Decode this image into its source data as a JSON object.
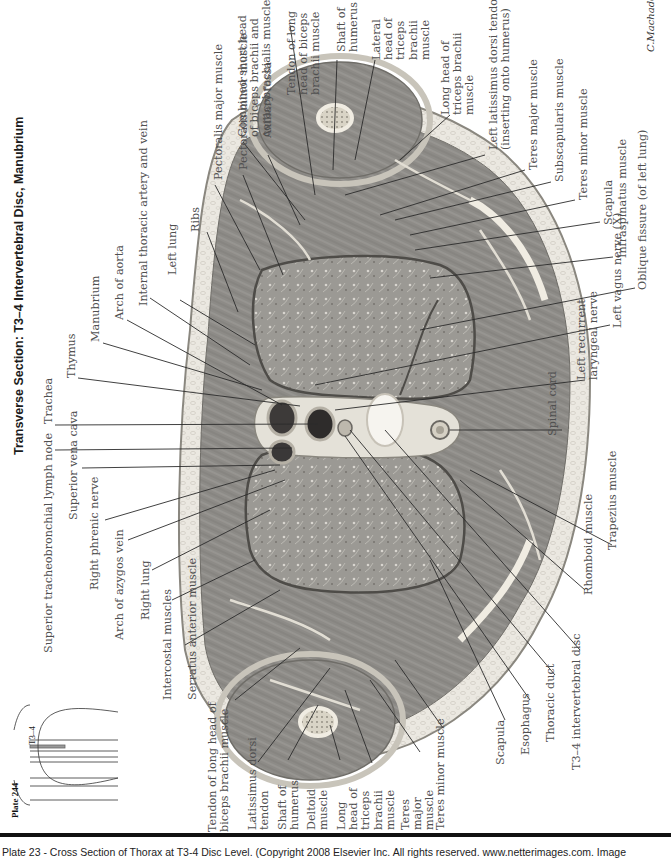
{
  "plate": {
    "title": "Transverse Section: T3–4 Intervertebral Disc, Manubrium",
    "plate_ref": "Plate 244",
    "level_marker": "T3–4",
    "signature": "C.Machado M.D."
  },
  "labels_top": [
    "Trachea",
    "Thymus",
    "Manubrium",
    "Arch of aorta",
    "Internal thoracic artery and vein",
    "Left lung",
    "Ribs",
    "Pectoralis major muscle",
    "Pectoralis minor muscle",
    "Axillary fossa",
    "Combined short head\nof biceps brachii and\ncoracobrachialis muscles",
    "Tendon of long\nhead of biceps\nbrachii muscle",
    "Shaft of\nhumerus",
    "Lateral\nhead of\ntriceps\nbrachii\nmuscle",
    "Long head of\ntriceps brachii\nmuscle",
    "Left latissimus dorsi tendon\n(inserting onto humerus)",
    "Teres major muscle",
    "Subscapularis muscle",
    "Teres minor muscle",
    "Scapula",
    "Infraspinatus muscle"
  ],
  "labels_right": [
    "Oblique fissure (of left lung)",
    "Left vagus nerve (X)",
    "Left recurrent\nlaryngeal nerve",
    "Spinal cord",
    "Trapezius muscle",
    "Rhomboid muscle"
  ],
  "labels_left": [
    "Superior tracheobronchial lymph node",
    "Superior vena cava",
    "Right phrenic nerve",
    "Arch of azygos vein",
    "Right lung",
    "Intercostal muscles",
    "Serratus anterior muscle"
  ],
  "labels_bottom": [
    "Tendon of long head of\nbiceps brachii muscle",
    "Latissimus dorsi\ntendon",
    "Shaft of\nhumerus",
    "Deltoid\nmuscle",
    "Long\nhead of\ntriceps\nbrachii\nmuscle",
    "Teres\nmajor\nmuscle",
    "Teres minor muscle",
    "Scapula",
    "Esophagus",
    "Thoracic duct",
    "T3–4 intervertebral disc"
  ],
  "footer": {
    "caption": "Plate 23 - Cross Section of Thorax at T3-4 Disc Level. (Copyright 2008 Elsevier Inc. All rights reserved. www.netterimages.com. Image"
  },
  "colors": {
    "tissue_fat": "#e9e6df",
    "muscle": "#8c8a86",
    "lung": "#9a9893",
    "bone": "#e4dfd2",
    "vessel_dark": "#3a3838",
    "ink": "#2b2b2b"
  }
}
